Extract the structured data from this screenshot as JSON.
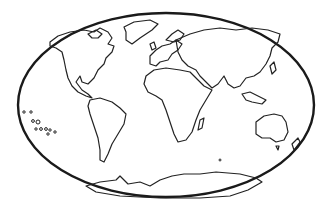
{
  "image": {
    "subject": "world map line-art outline",
    "style": "black outline on white, oval frame",
    "colors": {
      "background": "#ffffff",
      "stroke": "#222222"
    },
    "regions": [
      "North America",
      "South America",
      "Europe",
      "Africa",
      "Asia",
      "Australia",
      "Antarctica",
      "Greenland",
      "New Zealand",
      "Pacific Islands"
    ]
  }
}
